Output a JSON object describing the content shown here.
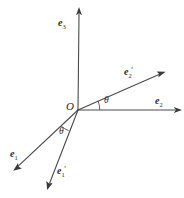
{
  "figure": {
    "type": "vector-diagram",
    "background_color": "#ffffff",
    "line_color": "#4a4a4a",
    "text_color": "#2b2b2b",
    "width": 184,
    "height": 198,
    "origin": {
      "label": "O",
      "x": 78,
      "y": 110,
      "label_x": 66,
      "label_y": 101
    },
    "axes": [
      {
        "name": "e3-axis",
        "base": "e",
        "subscript": "3",
        "prime": "",
        "from": {
          "x": 78,
          "y": 110
        },
        "to": {
          "x": 79,
          "y": 9
        },
        "label_x": 58,
        "label_y": 13,
        "dashed": false
      },
      {
        "name": "e2-axis",
        "base": "e",
        "subscript": "2",
        "prime": "",
        "from": {
          "x": 78,
          "y": 110
        },
        "to": {
          "x": 181,
          "y": 110
        },
        "label_x": 155,
        "label_y": 91,
        "dashed": false
      },
      {
        "name": "e2-prime-axis",
        "base": "e",
        "subscript": "2",
        "prime": "′",
        "from": {
          "x": 78,
          "y": 110
        },
        "to": {
          "x": 165,
          "y": 72
        },
        "label_x": 124,
        "label_y": 62,
        "dashed": false
      },
      {
        "name": "e1-axis",
        "base": "e",
        "subscript": "1",
        "prime": "",
        "from": {
          "x": 78,
          "y": 110
        },
        "to": {
          "x": 13,
          "y": 171
        },
        "label_x": 10,
        "label_y": 144,
        "dashed": false
      },
      {
        "name": "e1-prime-axis",
        "base": "e",
        "subscript": "1",
        "prime": "′",
        "from": {
          "x": 78,
          "y": 110
        },
        "to": {
          "x": 47,
          "y": 190
        },
        "label_x": 57,
        "label_y": 161,
        "dashed": false
      }
    ],
    "angles": [
      {
        "name": "theta-upper",
        "symbol": "θ",
        "between": [
          "e2-prime-axis",
          "e2-axis"
        ],
        "label_x": 104,
        "label_y": 96,
        "arc_radius": 22
      },
      {
        "name": "theta-lower",
        "symbol": "θ",
        "between": [
          "e1-axis",
          "e1-prime-axis"
        ],
        "label_x": 59,
        "label_y": 127,
        "arc_radius": 24
      }
    ]
  }
}
